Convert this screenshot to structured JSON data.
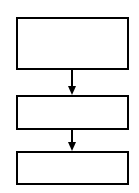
{
  "diagram": {
    "type": "flowchart",
    "colors": {
      "stroke": "#000000",
      "fill": "#ffffff"
    },
    "nodes": [
      {
        "id": "box-1",
        "label": ""
      },
      {
        "id": "box-2",
        "label": ""
      },
      {
        "id": "box-3",
        "label": ""
      }
    ],
    "edges": [
      {
        "from": "box-1",
        "to": "box-2"
      },
      {
        "from": "box-2",
        "to": "box-3"
      }
    ]
  }
}
